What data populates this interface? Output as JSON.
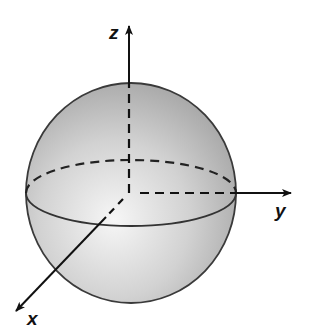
{
  "diagram": {
    "type": "3d-sphere-with-axes",
    "axes": {
      "x": {
        "label": "x"
      },
      "y": {
        "label": "y"
      },
      "z": {
        "label": "z"
      }
    },
    "colors": {
      "sphere_fill_light": "#f4f4f4",
      "sphere_fill_dark": "#a9a9a9",
      "stroke": "#333333",
      "axis": "#111111"
    }
  }
}
